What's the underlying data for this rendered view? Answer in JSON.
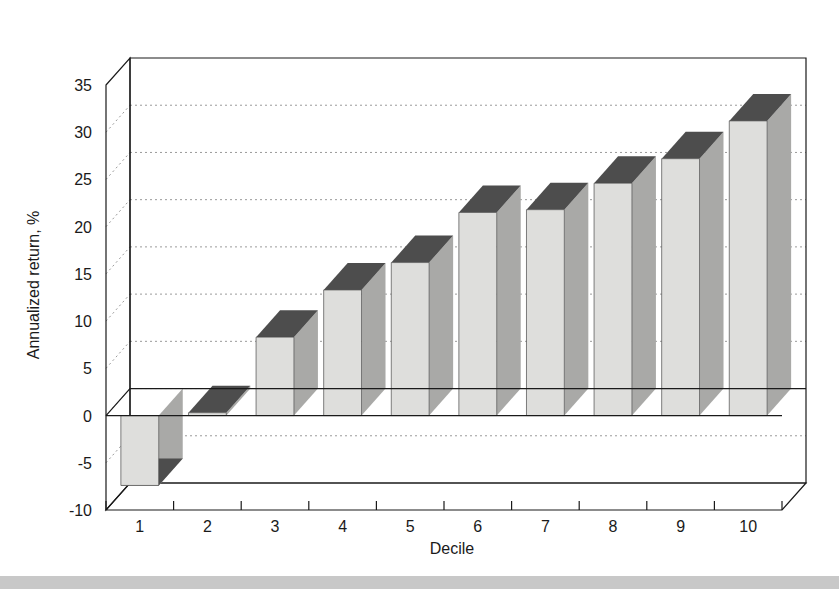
{
  "figure": {
    "background_color": "#ffffff",
    "footer_band_color": "#c8c8c8"
  },
  "chart_data": {
    "type": "bar",
    "title": "",
    "subtitle": "",
    "xlabel": "Decile",
    "ylabel": "Annualized return, %",
    "categories": [
      "1",
      "2",
      "3",
      "4",
      "5",
      "6",
      "7",
      "8",
      "9",
      "10"
    ],
    "values": [
      -7.4,
      0.3,
      8.3,
      13.3,
      16.2,
      21.5,
      21.8,
      24.6,
      27.2,
      31.2
    ],
    "ylim": [
      -10,
      35
    ],
    "ytick_labels": [
      "35",
      "30",
      "25",
      "20",
      "15",
      "10",
      "5",
      "0",
      "-5",
      "-10"
    ],
    "yticks": [
      35,
      30,
      25,
      20,
      15,
      10,
      5,
      0,
      -5,
      -10
    ],
    "grid": true,
    "grid_orientation": "horizontal",
    "legend": "none",
    "style": "3d-bar",
    "bar_face_color": "#dededc",
    "bar_side_color": "#a9a9a7",
    "bar_top_color": "#4d4d4d",
    "axis_color": "#1a1a1a",
    "grid_color": "#9a9a9a"
  },
  "axes": {
    "y_axis_title": "Annualized return, %",
    "x_axis_title": "Decile"
  }
}
